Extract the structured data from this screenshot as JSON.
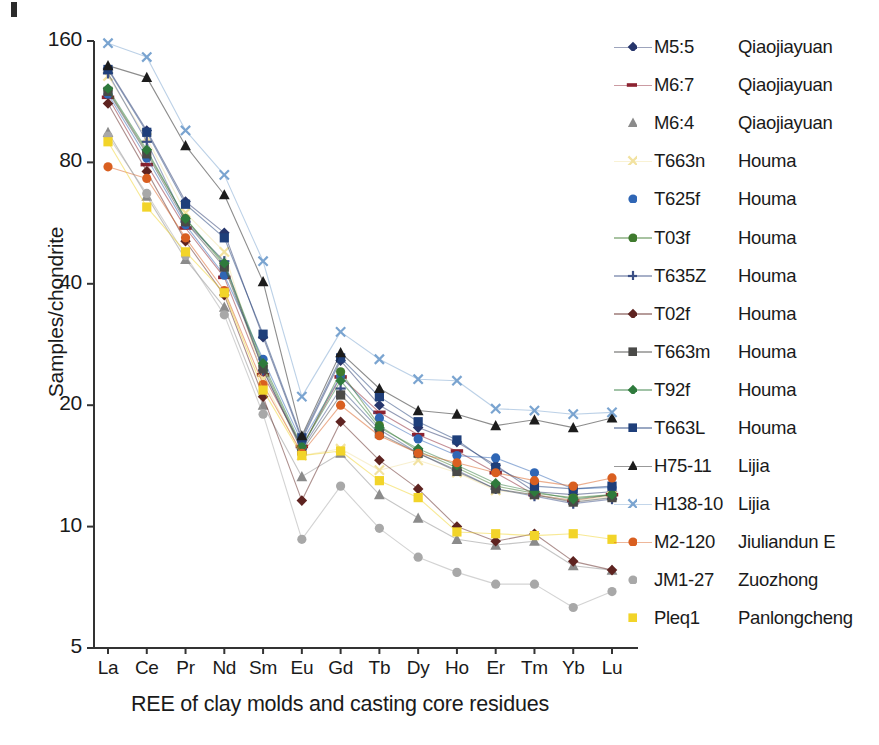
{
  "figure": {
    "panel_mark": "panel-label-bar"
  },
  "chart_data": {
    "type": "line",
    "title": "",
    "xlabel": "REE of clay molds and casting core residues",
    "ylabel": "Samples/chondrite",
    "yscale": "log",
    "ylim": [
      5,
      160
    ],
    "yticks": [
      5,
      10,
      20,
      40,
      80,
      160
    ],
    "ytick_labels": [
      "5",
      "10",
      "20",
      "40",
      "80",
      "160"
    ],
    "grid": false,
    "legend_position": "right",
    "categories": [
      "La",
      "Ce",
      "Pr",
      "Nd",
      "Sm",
      "Eu",
      "Gd",
      "Tb",
      "Dy",
      "Ho",
      "Er",
      "Tm",
      "Yb",
      "Lu"
    ],
    "series": [
      {
        "name": "M5:5",
        "site": "Qiaojiayuan",
        "color": "#26356b",
        "marker": "diamond",
        "values": [
          137,
          96,
          64,
          53.5,
          29.5,
          16.4,
          25.8,
          20.0,
          17.6,
          16.2,
          14.2,
          12.2,
          12.0,
          12.2
        ]
      },
      {
        "name": "M6:7",
        "site": "Qiaojiayuan",
        "color": "#8c2230",
        "marker": "dash",
        "values": [
          116,
          79,
          55,
          41.5,
          23.8,
          15.8,
          23.5,
          19.2,
          16.9,
          15.4,
          13.6,
          12.0,
          11.6,
          12.0
        ]
      },
      {
        "name": "M6:4",
        "site": "Qiaojiayuan",
        "color": "#8b8b8b",
        "marker": "triangle",
        "values": [
          95,
          66,
          46,
          35.0,
          20.0,
          13.3,
          15.2,
          12.0,
          10.5,
          9.3,
          9.0,
          9.2,
          8.0,
          7.8
        ]
      },
      {
        "name": "T663n",
        "site": "Houma",
        "color": "#f2e2a0",
        "marker": "x",
        "values": [
          131,
          92,
          60,
          48.0,
          23.2,
          15.0,
          15.6,
          13.8,
          14.6,
          13.6,
          12.3,
          12.0,
          11.6,
          11.9
        ]
      },
      {
        "name": "T625f",
        "site": "Houma",
        "color": "#2f66b5",
        "marker": "circle",
        "values": [
          118,
          82,
          56,
          42.0,
          26.0,
          16.2,
          23.6,
          18.6,
          16.5,
          15.0,
          14.8,
          13.6,
          12.4,
          12.5
        ]
      },
      {
        "name": "T03f",
        "site": "Houma",
        "color": "#3f7a2e",
        "marker": "circle",
        "values": [
          121,
          85,
          58,
          44.5,
          25.0,
          15.6,
          24.2,
          17.8,
          15.4,
          14.0,
          12.6,
          12.1,
          11.8,
          12.0
        ]
      },
      {
        "name": "T635Z",
        "site": "Houma",
        "color": "#3b4f86",
        "marker": "plus",
        "values": [
          133,
          90,
          57,
          45.5,
          24.4,
          15.6,
          22.0,
          17.4,
          15.2,
          13.8,
          12.4,
          11.9,
          11.4,
          11.7
        ]
      },
      {
        "name": "T02f",
        "site": "Houma",
        "color": "#5e2320",
        "marker": "diamond",
        "values": [
          112,
          76,
          51,
          37.5,
          21.0,
          11.6,
          18.2,
          14.6,
          12.4,
          10.0,
          9.2,
          9.6,
          8.2,
          7.8
        ]
      },
      {
        "name": "T663m",
        "site": "Houma",
        "color": "#4a4a48",
        "marker": "square",
        "values": [
          120,
          84,
          57,
          44.0,
          24.6,
          15.4,
          21.2,
          17.0,
          15.2,
          13.7,
          12.4,
          12.0,
          11.5,
          11.8
        ]
      },
      {
        "name": "T92f",
        "site": "Houma",
        "color": "#2e7a3c",
        "marker": "diamond",
        "values": [
          122,
          86,
          58,
          45.0,
          25.4,
          15.8,
          23.0,
          17.6,
          15.6,
          14.2,
          12.8,
          12.2,
          11.7,
          12.0
        ]
      },
      {
        "name": "T663L",
        "site": "Houma",
        "color": "#1f3f7a",
        "marker": "square",
        "values": [
          136,
          95,
          63,
          52.0,
          30.0,
          16.6,
          26.2,
          21.0,
          18.2,
          16.4,
          14.0,
          12.6,
          12.4,
          12.6
        ]
      },
      {
        "name": "H75-11",
        "site": "Lijia",
        "color": "#1c1c1c",
        "marker": "triangle",
        "values": [
          139,
          130,
          88,
          66.5,
          40.5,
          16.8,
          27.0,
          22.0,
          19.4,
          19.0,
          17.8,
          18.4,
          17.6,
          18.6
        ]
      },
      {
        "name": "H138-10",
        "site": "Lijia",
        "color": "#7aa4d0",
        "marker": "x",
        "values": [
          158,
          146,
          96,
          74.5,
          45.5,
          21.0,
          30.4,
          26.0,
          23.2,
          23.0,
          19.6,
          19.4,
          19.0,
          19.2
        ]
      },
      {
        "name": "M2-120",
        "site": "Jiuliandun E",
        "color": "#d95f20",
        "marker": "circle",
        "values": [
          78,
          73,
          52,
          38.5,
          22.5,
          15.2,
          20.0,
          16.8,
          15.2,
          14.4,
          13.6,
          13.0,
          12.6,
          13.2
        ]
      },
      {
        "name": "JM1-27",
        "site": "Zuozhong",
        "color": "#a8a8a8",
        "marker": "circle",
        "values": [
          93,
          67,
          47,
          33.5,
          19.0,
          9.3,
          12.6,
          9.9,
          8.4,
          7.7,
          7.2,
          7.2,
          6.3,
          6.9
        ]
      },
      {
        "name": "Pleq1",
        "site": "Panlongcheng",
        "color": "#f2d429",
        "marker": "square",
        "values": [
          90,
          62,
          48,
          38.0,
          21.8,
          15.0,
          15.4,
          13.0,
          11.8,
          9.7,
          9.6,
          9.5,
          9.6,
          9.3
        ]
      }
    ]
  }
}
